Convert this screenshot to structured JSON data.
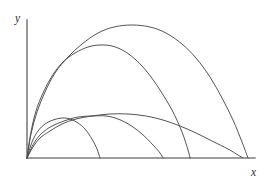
{
  "figure": {
    "name": "projectile-trajectories-diagram",
    "background_color": "#ffffff",
    "width": 269,
    "height": 181
  },
  "axes": {
    "x_label": "x",
    "y_label": "y",
    "origin_px": [
      27,
      158
    ],
    "x_axis_end_px": [
      255,
      158
    ],
    "y_axis_top_px": [
      27,
      20
    ],
    "axis_color": "#7d7d7d",
    "label_color": "#2b2b2b",
    "ticks": [],
    "tick_labels": [],
    "grid": false
  },
  "chart_data": {
    "type": "line",
    "title": "",
    "xlabel": "x",
    "ylabel": "y",
    "grid": false,
    "legend": "none",
    "xlim": [
      0,
      1
    ],
    "ylim": [
      0,
      1
    ],
    "curve_color": "#4a4a4a",
    "series": [
      {
        "name": "trajectory-1",
        "launch_angle_rank": 1,
        "apex_px": [
          67,
          119
        ],
        "landing_px": [
          100,
          158
        ],
        "points_px": [
          [
            27,
            158
          ],
          [
            32,
            142
          ],
          [
            38,
            131
          ],
          [
            45,
            124
          ],
          [
            53,
            120
          ],
          [
            62,
            118
          ],
          [
            70,
            119
          ],
          [
            78,
            123
          ],
          [
            85,
            129
          ],
          [
            92,
            139
          ],
          [
            97,
            149
          ],
          [
            100,
            158
          ]
        ]
      },
      {
        "name": "trajectory-2",
        "launch_angle_rank": 2,
        "apex_px": [
          103,
          116
        ],
        "landing_px": [
          163,
          158
        ],
        "points_px": [
          [
            27,
            158
          ],
          [
            34,
            143
          ],
          [
            42,
            133
          ],
          [
            52,
            126
          ],
          [
            64,
            121
          ],
          [
            78,
            117
          ],
          [
            92,
            116
          ],
          [
            106,
            116
          ],
          [
            118,
            119
          ],
          [
            130,
            125
          ],
          [
            142,
            134
          ],
          [
            153,
            145
          ],
          [
            160,
            153
          ],
          [
            163,
            158
          ]
        ]
      },
      {
        "name": "trajectory-3",
        "launch_angle_rank": 3,
        "apex_px": [
          127,
          114
        ],
        "landing_px": [
          243,
          158
        ],
        "points_px": [
          [
            27,
            158
          ],
          [
            33,
            147
          ],
          [
            40,
            138
          ],
          [
            50,
            131
          ],
          [
            62,
            124
          ],
          [
            76,
            119
          ],
          [
            92,
            116
          ],
          [
            110,
            114
          ],
          [
            128,
            114
          ],
          [
            146,
            116
          ],
          [
            163,
            120
          ],
          [
            180,
            126
          ],
          [
            196,
            133
          ],
          [
            212,
            141
          ],
          [
            228,
            149
          ],
          [
            238,
            155
          ],
          [
            243,
            158
          ]
        ]
      },
      {
        "name": "trajectory-4",
        "launch_angle_rank": 4,
        "apex_px": [
          110,
          46
        ],
        "landing_px": [
          190,
          158
        ],
        "points_px": [
          [
            27,
            158
          ],
          [
            31,
            132
          ],
          [
            36,
            111
          ],
          [
            43,
            93
          ],
          [
            52,
            76
          ],
          [
            63,
            62
          ],
          [
            75,
            53
          ],
          [
            88,
            47
          ],
          [
            100,
            45
          ],
          [
            112,
            46
          ],
          [
            124,
            51
          ],
          [
            136,
            60
          ],
          [
            148,
            73
          ],
          [
            160,
            90
          ],
          [
            172,
            110
          ],
          [
            182,
            132
          ],
          [
            188,
            150
          ],
          [
            190,
            158
          ]
        ]
      },
      {
        "name": "trajectory-5",
        "launch_angle_rank": 5,
        "apex_px": [
          136,
          26
        ],
        "landing_px": [
          248,
          158
        ],
        "points_px": [
          [
            27,
            158
          ],
          [
            31,
            134
          ],
          [
            37,
            112
          ],
          [
            45,
            92
          ],
          [
            55,
            73
          ],
          [
            68,
            57
          ],
          [
            82,
            44
          ],
          [
            98,
            33
          ],
          [
            114,
            27
          ],
          [
            132,
            25
          ],
          [
            150,
            27
          ],
          [
            166,
            33
          ],
          [
            182,
            44
          ],
          [
            196,
            58
          ],
          [
            210,
            77
          ],
          [
            222,
            98
          ],
          [
            233,
            120
          ],
          [
            242,
            142
          ],
          [
            248,
            158
          ]
        ]
      }
    ]
  }
}
